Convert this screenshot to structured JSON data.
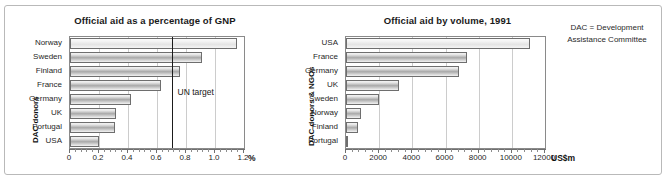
{
  "figure": {
    "note": "DAC = Development Assistance Committee",
    "note_line1": "DAC = Development",
    "note_line2": "Assistance Committee"
  },
  "chart_data": [
    {
      "type": "bar",
      "orientation": "horizontal",
      "title": "Official aid as a percentage of GNP",
      "xlabel": "%",
      "ylabel": "DAC donors",
      "categories": [
        "Norway",
        "Sweden",
        "Finland",
        "France",
        "Germany",
        "UK",
        "Portugal",
        "USA"
      ],
      "values": [
        1.15,
        0.91,
        0.76,
        0.63,
        0.42,
        0.32,
        0.31,
        0.2
      ],
      "xlim": [
        0,
        1.2
      ],
      "xticks": [
        0,
        0.2,
        0.4,
        0.6,
        0.8,
        1.0,
        1.2
      ],
      "xticklabels": [
        "0",
        "0.2",
        "0.4",
        "0.6",
        "0.8",
        "1.0",
        "1.2"
      ],
      "grid": true,
      "annotations": [
        {
          "label": "UN target",
          "value": 0.7,
          "kind": "vertical-line"
        }
      ]
    },
    {
      "type": "bar",
      "orientation": "horizontal",
      "title": "Official aid by volume, 1991",
      "xlabel": "US$m",
      "ylabel": "DAC donors & NGOs",
      "categories": [
        "USA",
        "France",
        "Germany",
        "UK",
        "Sweden",
        "Norway",
        "Finland",
        "Portugal"
      ],
      "values": [
        11100,
        7300,
        6800,
        3200,
        2000,
        900,
        750,
        100
      ],
      "xlim": [
        0,
        12000
      ],
      "xticks": [
        0,
        2000,
        4000,
        6000,
        8000,
        10000,
        12000
      ],
      "xticklabels": [
        "0",
        "2000",
        "4000",
        "6000",
        "8000",
        "10000",
        "12000"
      ],
      "grid": true,
      "annotations": []
    }
  ]
}
